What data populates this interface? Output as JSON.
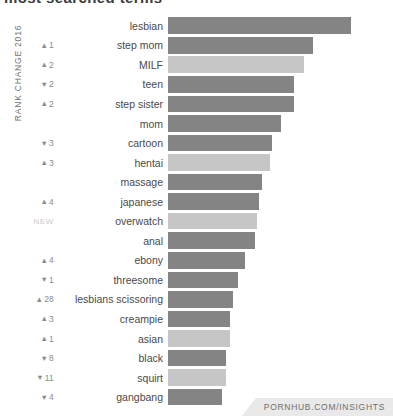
{
  "headline": "most searched terms",
  "axis_caption": "RANK CHANGE 2016",
  "footer": {
    "credit": "PORNHUB.COM/INSIGHTS"
  },
  "colors": {
    "bar_dark": "#848484",
    "bar_light": "#c6c6c6",
    "label_text": "#4a4a4a",
    "rank_text": "#8c8c8c",
    "new_text": "#c9c9c9",
    "ribbon_bg": "#e9e9e9"
  },
  "icons": {
    "up_arrow": "▲",
    "down_arrow": "▼"
  },
  "chart_data": {
    "type": "bar",
    "orientation": "horizontal",
    "title": "most searched terms",
    "xlabel": "",
    "ylabel": "RANK CHANGE 2016",
    "grid": false,
    "legend": "none",
    "xlim": [
      0,
      100
    ],
    "categories": [
      "lesbian",
      "step mom",
      "MILF",
      "teen",
      "step sister",
      "mom",
      "cartoon",
      "hentai",
      "massage",
      "japanese",
      "overwatch",
      "anal",
      "ebony",
      "threesome",
      "lesbians scissoring",
      "creampie",
      "asian",
      "black",
      "squirt",
      "gangbang"
    ],
    "values": [
      100,
      79.5,
      74.5,
      69,
      69,
      61.5,
      57,
      56,
      51.5,
      49.5,
      48.5,
      47.5,
      42,
      38.5,
      35.5,
      34,
      34,
      31.5,
      31.5,
      29.5
    ],
    "rank_change": [
      {
        "direction": "none",
        "value": ""
      },
      {
        "direction": "up",
        "value": "1"
      },
      {
        "direction": "up",
        "value": "2"
      },
      {
        "direction": "down",
        "value": "2"
      },
      {
        "direction": "up",
        "value": "2"
      },
      {
        "direction": "none",
        "value": ""
      },
      {
        "direction": "down",
        "value": "3"
      },
      {
        "direction": "up",
        "value": "3"
      },
      {
        "direction": "none",
        "value": ""
      },
      {
        "direction": "up",
        "value": "4"
      },
      {
        "direction": "new",
        "value": "NEW"
      },
      {
        "direction": "none",
        "value": ""
      },
      {
        "direction": "up",
        "value": "4"
      },
      {
        "direction": "down",
        "value": "1"
      },
      {
        "direction": "up",
        "value": "28"
      },
      {
        "direction": "up",
        "value": "3"
      },
      {
        "direction": "up",
        "value": "1"
      },
      {
        "direction": "down",
        "value": "8"
      },
      {
        "direction": "down",
        "value": "11"
      },
      {
        "direction": "down",
        "value": "4"
      }
    ],
    "bar_shades": [
      "dark",
      "dark",
      "light",
      "dark",
      "dark",
      "dark",
      "dark",
      "light",
      "dark",
      "dark",
      "light",
      "dark",
      "dark",
      "dark",
      "dark",
      "dark",
      "light",
      "dark",
      "light",
      "dark"
    ]
  }
}
